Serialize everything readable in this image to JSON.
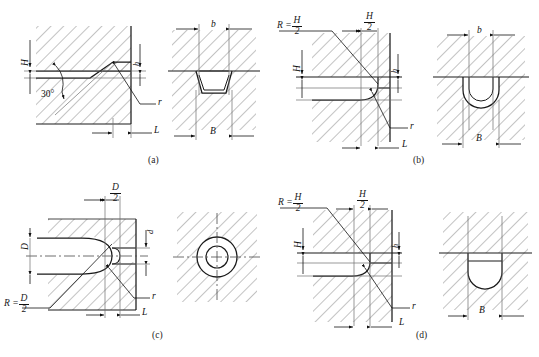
{
  "figure": {
    "kind": "engineering-drawing",
    "panel_count": 4,
    "captions": [
      "(a)",
      "(b)",
      "(c)",
      "(d)"
    ],
    "line_color": "#1a1a1a",
    "hatch_color": "#8c8c8c",
    "thin_line_color": "#6f6f6f",
    "background": "#ffffff"
  },
  "panels": {
    "a": {
      "caption": "(a)",
      "labels": {
        "H": "H",
        "h": "h",
        "angle": "30°",
        "r": "r",
        "L": "L",
        "b": "b",
        "B": "B"
      }
    },
    "b": {
      "caption": "(b)",
      "labels": {
        "R_eq": "R =",
        "R_num": "H",
        "R_den": "2",
        "half_num": "H",
        "half_den": "2",
        "H": "H",
        "h": "h",
        "r": "r",
        "L": "L",
        "b": "b",
        "B": "B"
      }
    },
    "c": {
      "caption": "(c)",
      "labels": {
        "top_num": "D",
        "top_den": "2",
        "D": "D",
        "d": "d",
        "r": "r",
        "L": "L",
        "R_eq": "R =",
        "R_num": "D",
        "R_den": "2"
      }
    },
    "d": {
      "caption": "(d)",
      "labels": {
        "R_eq": "R =",
        "R_num": "H",
        "R_den": "2",
        "half_num": "H",
        "half_den": "2",
        "H": "H",
        "h": "h",
        "r": "r",
        "L": "L",
        "B": "B"
      }
    }
  }
}
